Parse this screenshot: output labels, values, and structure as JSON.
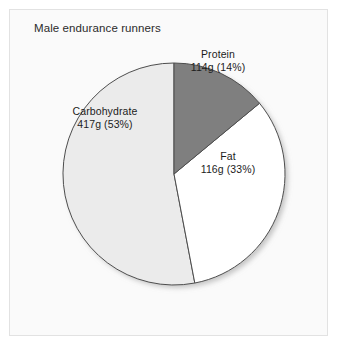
{
  "chart_data": {
    "type": "pie",
    "title": "Male endurance runners",
    "xlabel": "",
    "ylabel": "",
    "legend": "none",
    "grid": false,
    "unit": "g",
    "categories": [
      "Protein",
      "Fat",
      "Carbohydrate"
    ],
    "values": [
      114,
      116,
      417
    ],
    "percentages": [
      14,
      33,
      53
    ],
    "start_angle_deg": 0,
    "direction": "clockwise",
    "slices": [
      {
        "name": "Protein",
        "grams": 114,
        "percent": 14,
        "value_label": "114g (14%)",
        "color": "#7f7f7f",
        "start_angle_deg": 0.0,
        "end_angle_deg": 50.4
      },
      {
        "name": "Fat",
        "grams": 116,
        "percent": 33,
        "value_label": "116g (33%)",
        "color": "#ffffff",
        "start_angle_deg": 50.4,
        "end_angle_deg": 169.2
      },
      {
        "name": "Carbohydrate",
        "grams": 417,
        "percent": 53,
        "value_label": "417g (53%)",
        "color": "#ebebeb",
        "start_angle_deg": 169.2,
        "end_angle_deg": 360.0
      }
    ]
  },
  "colors": {
    "page_background": "#ffffff",
    "panel_background": "#fafafa",
    "panel_border": "#e2e2e2",
    "slice_outline": "#4d4d4d",
    "text": "#1c1c1c",
    "shadow": "#bdbdbd"
  }
}
